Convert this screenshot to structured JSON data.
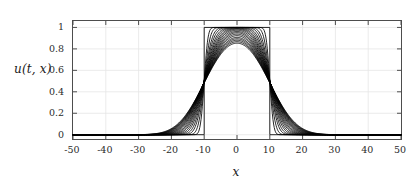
{
  "chart_data": {
    "type": "line",
    "title": "",
    "subtitle": "",
    "xlabel": "x",
    "ylabel": "u(t, x)",
    "xlim": [
      -50,
      50
    ],
    "ylim": [
      -0.04,
      1.06
    ],
    "xticks": [
      -50,
      -40,
      -30,
      -20,
      -10,
      0,
      10,
      20,
      30,
      40,
      50
    ],
    "xticklabels": [
      "-50",
      "-40",
      "-30",
      "-20",
      "-10",
      "0",
      "10",
      "20",
      "30",
      "40",
      "50"
    ],
    "yticks": [
      0,
      0.2,
      0.4,
      0.6,
      0.8,
      1
    ],
    "yticklabels": [
      "0",
      "0.2",
      "0.4",
      "0.6",
      "0.8",
      "1"
    ],
    "grid": true,
    "grid_color": "#e6e6e6",
    "axis_color": "#4d4d4d",
    "line_color": "#000000",
    "background": "#ffffff",
    "legend": null,
    "annotations": [],
    "series": [
      {
        "name": "t = 0.0",
        "diffusion_sigma": 0.0,
        "amplitude": 1.0,
        "half_width": 10
      },
      {
        "name": "t = 0.5",
        "diffusion_sigma": 0.9,
        "amplitude": 1.0,
        "half_width": 10
      },
      {
        "name": "t = 1.0",
        "diffusion_sigma": 1.4,
        "amplitude": 1.0,
        "half_width": 10
      },
      {
        "name": "t = 1.5",
        "diffusion_sigma": 1.9,
        "amplitude": 1.0,
        "half_width": 10
      },
      {
        "name": "t = 2.0",
        "diffusion_sigma": 2.3,
        "amplitude": 1.0,
        "half_width": 10
      },
      {
        "name": "t = 2.5",
        "diffusion_sigma": 2.7,
        "amplitude": 0.999,
        "half_width": 10
      },
      {
        "name": "t = 3.0",
        "diffusion_sigma": 3.05,
        "amplitude": 0.999,
        "half_width": 10
      },
      {
        "name": "t = 3.5",
        "diffusion_sigma": 3.4,
        "amplitude": 0.998,
        "half_width": 10
      },
      {
        "name": "t = 4.0",
        "diffusion_sigma": 3.7,
        "amplitude": 0.997,
        "half_width": 10
      },
      {
        "name": "t = 4.5",
        "diffusion_sigma": 4.0,
        "amplitude": 0.996,
        "half_width": 10
      },
      {
        "name": "t = 5.0",
        "diffusion_sigma": 4.3,
        "amplitude": 0.994,
        "half_width": 10
      },
      {
        "name": "t = 5.5",
        "diffusion_sigma": 4.6,
        "amplitude": 0.992,
        "half_width": 10
      },
      {
        "name": "t = 6.0",
        "diffusion_sigma": 4.85,
        "amplitude": 0.99,
        "half_width": 10
      },
      {
        "name": "t = 6.5",
        "diffusion_sigma": 5.1,
        "amplitude": 0.987,
        "half_width": 10
      },
      {
        "name": "t = 7.0",
        "diffusion_sigma": 5.35,
        "amplitude": 0.984,
        "half_width": 10
      },
      {
        "name": "t = 7.5",
        "diffusion_sigma": 5.6,
        "amplitude": 0.98,
        "half_width": 10
      },
      {
        "name": "t = 8.0",
        "diffusion_sigma": 5.8,
        "amplitude": 0.977,
        "half_width": 10
      },
      {
        "name": "t = 8.5",
        "diffusion_sigma": 6.0,
        "amplitude": 0.974,
        "half_width": 10
      },
      {
        "name": "t = 9.0",
        "diffusion_sigma": 6.2,
        "amplitude": 0.971,
        "half_width": 10
      },
      {
        "name": "t = 9.5",
        "diffusion_sigma": 6.4,
        "amplitude": 0.968,
        "half_width": 10
      }
    ],
    "key_points": {
      "pulse_left_edge_x": -10,
      "pulse_right_edge_x": 10,
      "pulse_height": 1,
      "baseline_value": 0,
      "peak_value_at_x0": 1,
      "min_peak_value_at_x0": 0.965,
      "outer_spread_extent_x": 22
    }
  }
}
